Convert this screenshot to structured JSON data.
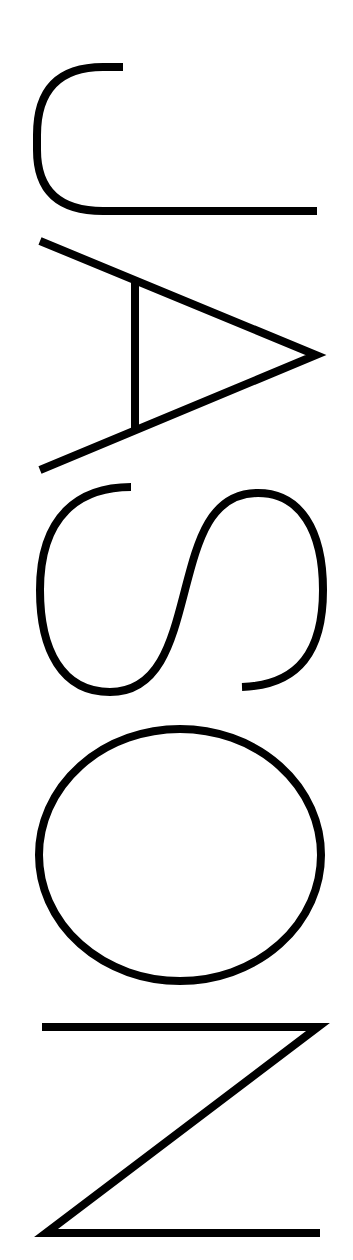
{
  "logo": {
    "text": "JASON",
    "letters": [
      "J",
      "A",
      "S",
      "O",
      "N"
    ],
    "orientation": "rotated 90deg clockwise",
    "stroke_color": "#000000",
    "background_color": "#ffffff"
  }
}
